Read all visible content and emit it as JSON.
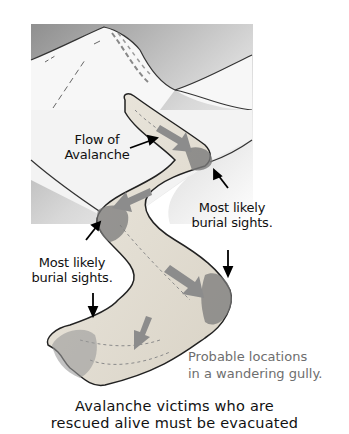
{
  "figure": {
    "colors": {
      "sky_shade": "#9a9a9a",
      "snow": "#f4f4f4",
      "gully_fill": "#e2ddd2",
      "debris": "#6b6b6b",
      "flow_arrow": "#8c8c8c",
      "outline": "#222222",
      "caption_gray": "#6e6e6e"
    }
  },
  "labels": {
    "flow": "Flow of\nAvalanche",
    "burial_right": "Most likely\nburial sights.",
    "burial_left": "Most likely\nburial sights."
  },
  "caption_gray": "Probable locations\nin a wandering gully.",
  "caption_bottom": "Avalanche victims who are\nrescued alive must be evacuated"
}
